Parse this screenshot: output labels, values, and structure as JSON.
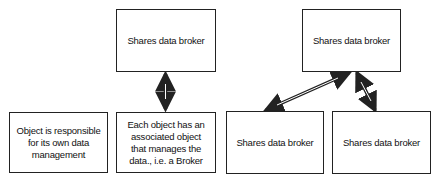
{
  "diagram": {
    "boxes": [
      {
        "id": "top-center",
        "label": "Shares data broker"
      },
      {
        "id": "top-right",
        "label": "Shares data broker"
      },
      {
        "id": "bottom-left",
        "label": "Object is responsible for its own data management"
      },
      {
        "id": "bottom-center",
        "label": "Each object has an associated object that manages the data., i.e. a Broker"
      },
      {
        "id": "bottom-right-1",
        "label": "Shares data broker"
      },
      {
        "id": "bottom-right-2",
        "label": "Shares data broker"
      }
    ],
    "connections": [
      {
        "from": "top-center",
        "to": "bottom-center",
        "type": "bidirectional"
      },
      {
        "from": "top-right",
        "to": "bottom-right-1",
        "type": "bidirectional"
      },
      {
        "from": "top-right",
        "to": "bottom-right-2",
        "type": "bidirectional"
      }
    ],
    "colors": {
      "line": "#222222",
      "background": "#ffffff"
    }
  }
}
